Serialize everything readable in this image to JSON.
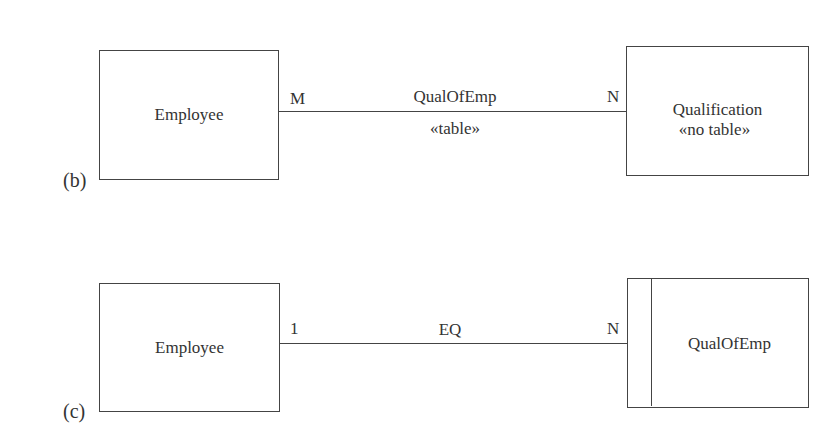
{
  "diagrams": [
    {
      "label": "(b)",
      "left_entity": {
        "name": "Employee"
      },
      "relationship": {
        "name": "QualOfEmp",
        "stereotype": "«table»",
        "left_cardinality": "M",
        "right_cardinality": "N"
      },
      "right_entity": {
        "name": "Qualification",
        "stereotype": "«no table»"
      }
    },
    {
      "label": "(c)",
      "left_entity": {
        "name": "Employee"
      },
      "relationship": {
        "name": "EQ",
        "left_cardinality": "1",
        "right_cardinality": "N",
        "end_marker": "filled-dot"
      },
      "right_entity": {
        "name": "QualOfEmp",
        "type": "weak-entity"
      }
    }
  ]
}
